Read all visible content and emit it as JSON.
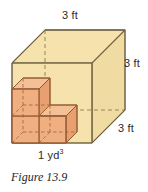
{
  "figure": {
    "caption": "Figure 13.9",
    "background_color": "#ffffff"
  },
  "diagram": {
    "type": "3d-oblique-cube-volume-illustration",
    "large_cube": {
      "name": "cubic-yard-box",
      "fill_color": "#f5e2ac",
      "stroke_color": "#8a7a55",
      "edge_length_label": "3 ft",
      "volume_label": "1 yd",
      "volume_exponent": "3"
    },
    "unit_cubes": {
      "name": "cubic-foot-unit-cubes",
      "count": 4,
      "front_fill_color": "#efaf80",
      "top_fill_color": "#f4c095",
      "side_fill_color": "#e8a070",
      "stroke_color": "#9c6238",
      "arrangement": "two-by-two-base-with-one-stacked-upper-left"
    }
  },
  "labels": {
    "top": "3 ft",
    "right": "3 ft",
    "depth": "3 ft",
    "bottom_value": "1 yd",
    "bottom_exponent": "3"
  }
}
